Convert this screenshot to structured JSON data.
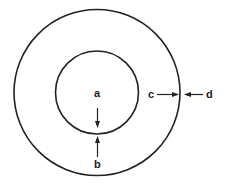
{
  "diagram": {
    "type": "concentric-circles",
    "colors": {
      "stroke": "#222222",
      "background": "#ffffff"
    },
    "labels": {
      "a": "a",
      "b": "b",
      "c": "c",
      "d": "d"
    },
    "arrows": [
      {
        "from": "a",
        "direction": "down",
        "points_to": "inner-circle-boundary"
      },
      {
        "from": "b",
        "direction": "up",
        "points_to": "inner-circle-boundary"
      },
      {
        "from": "c",
        "direction": "right",
        "points_to": "outer-circle-boundary"
      },
      {
        "from": "d",
        "direction": "left",
        "points_to": "outer-circle-boundary"
      }
    ]
  }
}
